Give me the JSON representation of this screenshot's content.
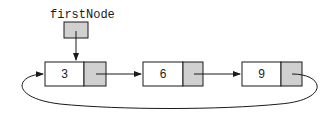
{
  "diagram": {
    "type": "circular-singly-linked-list",
    "head_pointer": {
      "label": "firstNode"
    },
    "nodes": [
      {
        "value": "3"
      },
      {
        "value": "6"
      },
      {
        "value": "9"
      }
    ],
    "edges": [
      {
        "from": "firstNode",
        "to": "node-0"
      },
      {
        "from": "node-0",
        "to": "node-1"
      },
      {
        "from": "node-1",
        "to": "node-2"
      },
      {
        "from": "node-2",
        "to": "node-0",
        "style": "curved-loop-back"
      }
    ],
    "colors": {
      "line": "#1a1a1a",
      "pointer_fill": "#d0d0d0",
      "data_fill": "#ffffff"
    }
  }
}
